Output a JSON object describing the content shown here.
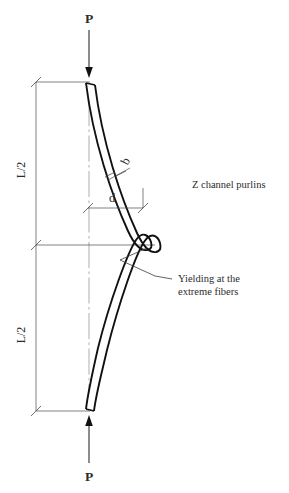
{
  "figure": {
    "background_color": "#ffffff",
    "line_color": "#111111",
    "dimension_color": "#4a4a4a",
    "center_line_color": "#8a8a8a"
  },
  "labels": {
    "force_top": "P",
    "force_bottom": "P",
    "half_span_upper": "L/2",
    "half_span_lower": "L/2",
    "flange_width": "b",
    "depth": "d",
    "member_note": "Z channel purlins",
    "yield_note_line1": "Yielding at the",
    "yield_note_line2": "extreme fibers"
  },
  "icons": {
    "arrow_down": "down-arrow-icon",
    "arrow_up": "up-arrow-icon",
    "dimension_tick": "dimension-tick-icon",
    "leader": "leader-line-icon"
  },
  "geometry": {
    "span_top_y": 82,
    "span_mid_y": 245,
    "span_bottom_y": 411,
    "center_line_x": 89,
    "extension_line_x": 36,
    "beam_top_x": 86,
    "beam_bottom_x": 86,
    "beam_bulge_x": 150
  }
}
